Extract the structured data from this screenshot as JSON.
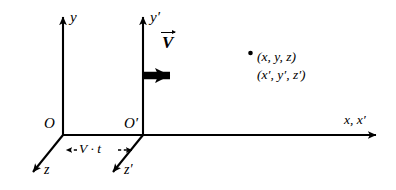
{
  "figure": {
    "background_color": "#ffffff",
    "stroke_color": "#000000",
    "width": 396,
    "height": 190
  },
  "labels": {
    "y_axis": "y",
    "y_prime_axis": "y′",
    "velocity_vector": "V",
    "point_unprimed": "(x, y, z)",
    "point_primed": "(x′, y′, z′)",
    "origin": "O",
    "origin_prime": "O′",
    "x_axis": "x, x′",
    "z_axis": "z",
    "z_prime_axis": "z′",
    "displacement": "V · t"
  },
  "geometry": {
    "origin": {
      "x": 63,
      "y": 135
    },
    "origin_prime": {
      "x": 143,
      "y": 135
    },
    "y_axis_tip": {
      "x": 63,
      "y": 12
    },
    "y_prime_axis_tip": {
      "x": 143,
      "y": 12
    },
    "x_axis_tip": {
      "x": 382,
      "y": 135
    },
    "z_axis_tip": {
      "x": 29,
      "y": 176
    },
    "z_prime_axis_tip": {
      "x": 109,
      "y": 176
    },
    "point_marker": {
      "x": 250,
      "y": 53
    },
    "velocity_arrow": {
      "x1": 144,
      "y1": 75,
      "x2": 181,
      "y2": 75
    },
    "displacement_arrow": {
      "x1": 62,
      "y1": 150,
      "x2": 136,
      "y2": 150
    }
  }
}
